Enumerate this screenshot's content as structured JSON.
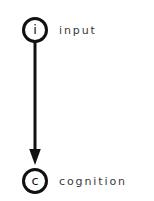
{
  "diagram": {
    "background_color": "#ffffff",
    "stroke_color": "#111111",
    "label_color": "#3a3a3a",
    "nodes": [
      {
        "id": "input",
        "glyph": "i",
        "label": "input",
        "shape": "circle-outline",
        "x": 35,
        "y": 30,
        "radius": 13
      },
      {
        "id": "cognition",
        "glyph": "c",
        "label": "cognition",
        "shape": "circle-outline",
        "x": 35,
        "y": 181,
        "radius": 13
      }
    ],
    "edges": [
      {
        "id": "input-to-cognition",
        "from": "input",
        "to": "cognition",
        "style": "solid",
        "arrowhead": "filled-triangle",
        "direction": "down",
        "x": 35,
        "y_start": 43,
        "y_end": 165,
        "width": 3
      }
    ]
  }
}
